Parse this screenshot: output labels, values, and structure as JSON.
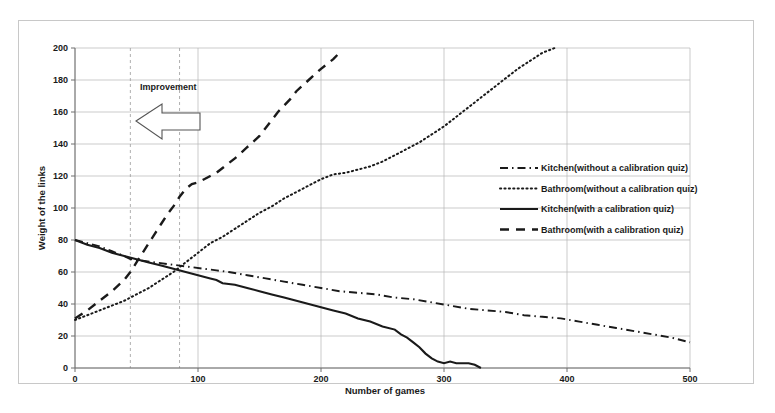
{
  "chart_data": {
    "type": "line",
    "title": "",
    "xlabel": "Number of games",
    "ylabel": "Weight of the links",
    "xlim": [
      0,
      500
    ],
    "ylim": [
      0,
      200
    ],
    "xticks": [
      "0",
      "100",
      "200",
      "300",
      "400",
      "500"
    ],
    "yticks": [
      "0",
      "20",
      "40",
      "60",
      "80",
      "100",
      "120",
      "140",
      "160",
      "180",
      "200"
    ],
    "grid": true,
    "legend_position": "center-right",
    "annotations": [
      {
        "text": "Improvement",
        "x": 60,
        "y": 172,
        "arrow": "left-block-arrow"
      }
    ],
    "reference_lines": [
      {
        "orientation": "vertical",
        "x": 45,
        "style": "dashed"
      },
      {
        "orientation": "vertical",
        "x": 85,
        "style": "dashed"
      }
    ],
    "series": [
      {
        "name": "Kitchen(without a calibration quiz)",
        "style": "dash-dot",
        "points": [
          [
            0,
            80
          ],
          [
            10,
            78
          ],
          [
            20,
            76
          ],
          [
            30,
            73
          ],
          [
            40,
            70
          ],
          [
            45,
            68
          ],
          [
            55,
            67
          ],
          [
            65,
            66
          ],
          [
            75,
            65
          ],
          [
            85,
            64
          ],
          [
            95,
            63
          ],
          [
            105,
            62
          ],
          [
            115,
            61
          ],
          [
            125,
            60
          ],
          [
            140,
            58
          ],
          [
            155,
            56
          ],
          [
            170,
            54
          ],
          [
            185,
            52
          ],
          [
            200,
            50
          ],
          [
            215,
            48
          ],
          [
            230,
            47
          ],
          [
            245,
            46
          ],
          [
            260,
            44
          ],
          [
            275,
            43
          ],
          [
            290,
            41
          ],
          [
            305,
            39
          ],
          [
            320,
            37
          ],
          [
            335,
            36
          ],
          [
            350,
            35
          ],
          [
            365,
            33
          ],
          [
            380,
            32
          ],
          [
            395,
            31
          ],
          [
            410,
            29
          ],
          [
            425,
            27
          ],
          [
            440,
            25
          ],
          [
            455,
            23
          ],
          [
            470,
            21
          ],
          [
            485,
            19
          ],
          [
            500,
            16
          ]
        ]
      },
      {
        "name": "Bathroom(without a calibration quiz)",
        "style": "dotted",
        "points": [
          [
            0,
            30
          ],
          [
            10,
            33
          ],
          [
            20,
            36
          ],
          [
            30,
            39
          ],
          [
            40,
            42
          ],
          [
            50,
            46
          ],
          [
            60,
            50
          ],
          [
            70,
            55
          ],
          [
            80,
            60
          ],
          [
            90,
            66
          ],
          [
            100,
            72
          ],
          [
            110,
            78
          ],
          [
            120,
            82
          ],
          [
            130,
            87
          ],
          [
            140,
            92
          ],
          [
            150,
            97
          ],
          [
            160,
            101
          ],
          [
            170,
            106
          ],
          [
            180,
            110
          ],
          [
            190,
            114
          ],
          [
            200,
            118
          ],
          [
            210,
            121
          ],
          [
            220,
            122
          ],
          [
            230,
            124
          ],
          [
            240,
            126
          ],
          [
            250,
            129
          ],
          [
            260,
            133
          ],
          [
            270,
            137
          ],
          [
            280,
            141
          ],
          [
            290,
            146
          ],
          [
            300,
            151
          ],
          [
            310,
            157
          ],
          [
            320,
            163
          ],
          [
            330,
            169
          ],
          [
            340,
            175
          ],
          [
            350,
            181
          ],
          [
            360,
            187
          ],
          [
            370,
            192
          ],
          [
            380,
            197
          ],
          [
            390,
            200
          ]
        ]
      },
      {
        "name": "Kitchen(with a calibration quiz)",
        "style": "solid",
        "points": [
          [
            0,
            80
          ],
          [
            10,
            77
          ],
          [
            20,
            75
          ],
          [
            30,
            72
          ],
          [
            40,
            70
          ],
          [
            50,
            68
          ],
          [
            60,
            66
          ],
          [
            70,
            64
          ],
          [
            80,
            62
          ],
          [
            90,
            60
          ],
          [
            100,
            58
          ],
          [
            110,
            56
          ],
          [
            115,
            55
          ],
          [
            120,
            53
          ],
          [
            130,
            52
          ],
          [
            140,
            50
          ],
          [
            150,
            48
          ],
          [
            160,
            46
          ],
          [
            170,
            44
          ],
          [
            180,
            42
          ],
          [
            190,
            40
          ],
          [
            200,
            38
          ],
          [
            210,
            36
          ],
          [
            220,
            34
          ],
          [
            230,
            31
          ],
          [
            240,
            29
          ],
          [
            250,
            26
          ],
          [
            260,
            24
          ],
          [
            265,
            21
          ],
          [
            270,
            19
          ],
          [
            275,
            16
          ],
          [
            280,
            13
          ],
          [
            285,
            9
          ],
          [
            290,
            6
          ],
          [
            295,
            4
          ],
          [
            300,
            3
          ],
          [
            305,
            4
          ],
          [
            310,
            3
          ],
          [
            315,
            3
          ],
          [
            320,
            3
          ],
          [
            325,
            2
          ],
          [
            330,
            0
          ]
        ]
      },
      {
        "name": "Bathroom(with a calibration quiz)",
        "style": "dashed",
        "points": [
          [
            0,
            31
          ],
          [
            10,
            36
          ],
          [
            20,
            42
          ],
          [
            30,
            48
          ],
          [
            40,
            55
          ],
          [
            45,
            60
          ],
          [
            50,
            66
          ],
          [
            55,
            72
          ],
          [
            60,
            78
          ],
          [
            65,
            84
          ],
          [
            70,
            90
          ],
          [
            75,
            96
          ],
          [
            80,
            101
          ],
          [
            85,
            107
          ],
          [
            90,
            112
          ],
          [
            95,
            115
          ],
          [
            100,
            116
          ],
          [
            105,
            118
          ],
          [
            110,
            120
          ],
          [
            115,
            122
          ],
          [
            120,
            125
          ],
          [
            130,
            131
          ],
          [
            140,
            138
          ],
          [
            150,
            145
          ],
          [
            155,
            150
          ],
          [
            160,
            155
          ],
          [
            165,
            160
          ],
          [
            170,
            164
          ],
          [
            175,
            168
          ],
          [
            180,
            173
          ],
          [
            190,
            180
          ],
          [
            200,
            187
          ],
          [
            210,
            193
          ],
          [
            215,
            197
          ]
        ]
      }
    ]
  },
  "legend": {
    "items": [
      {
        "label": "Kitchen(without a calibration quiz)",
        "style": "dash-dot"
      },
      {
        "label": "Bathroom(without a calibration quiz)",
        "style": "dotted"
      },
      {
        "label": "Kitchen(with a calibration quiz)",
        "style": "solid"
      },
      {
        "label": "Bathroom(with a calibration quiz)",
        "style": "dashed"
      }
    ]
  },
  "colors": {
    "line": "#1a1a1a",
    "grid": "#b4b4b4",
    "axis": "#6e6e6e",
    "frame": "#c8c8c8",
    "background": "#ffffff"
  }
}
